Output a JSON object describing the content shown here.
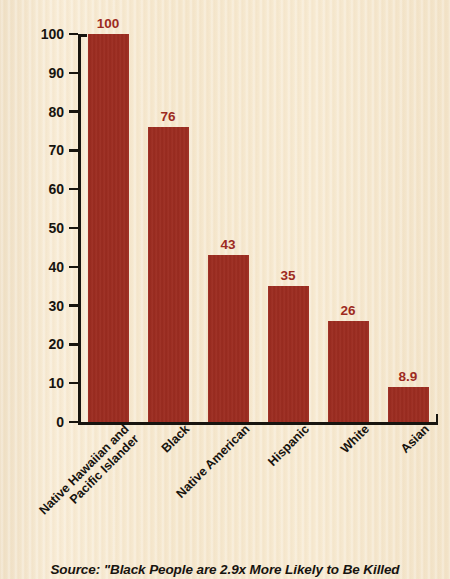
{
  "chart_data": {
    "type": "bar",
    "title": "",
    "xlabel": "",
    "ylabel": "Killings per 1 million people",
    "ylim": [
      0,
      100
    ],
    "yticks": [
      0,
      10,
      20,
      30,
      40,
      50,
      60,
      70,
      80,
      90,
      100
    ],
    "ytick_labels": [
      "0",
      "10",
      "20",
      "30",
      "40",
      "50",
      "60",
      "70",
      "80",
      "90",
      "100"
    ],
    "grid": false,
    "legend": "none",
    "categories": [
      "Native Hawaiian and Pacific Islander",
      "Black",
      "Native American",
      "Hispanic",
      "White",
      "Asian"
    ],
    "category_lines": [
      [
        "Native Hawaiian and",
        "Pacific Islander"
      ],
      [
        "Black"
      ],
      [
        "Native American"
      ],
      [
        "Hispanic"
      ],
      [
        "White"
      ],
      [
        "Asian"
      ]
    ],
    "values": [
      100,
      76,
      43,
      35,
      26,
      8.9
    ],
    "value_labels": [
      "100",
      "76",
      "43",
      "35",
      "26",
      "8.9"
    ],
    "bar_color": "#9d2b1f",
    "label_color": "#9d2b1f",
    "axis_color": "#17140f",
    "background_color": "#f6e8ce"
  },
  "caption": {
    "source": "Source: \"Black People are 2.9x More Likely to Be Killed"
  }
}
